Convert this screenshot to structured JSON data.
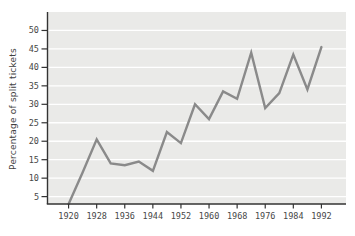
{
  "chart_data": {
    "type": "line",
    "title": "",
    "ylabel": "Percentage of split tickets",
    "xlabel": "",
    "x": [
      1920,
      1924,
      1928,
      1932,
      1936,
      1940,
      1944,
      1948,
      1952,
      1956,
      1960,
      1964,
      1968,
      1972,
      1976,
      1980,
      1984,
      1988,
      1992
    ],
    "values": [
      3,
      11.5,
      20.5,
      14,
      13.5,
      14.5,
      12,
      22.5,
      19.5,
      30,
      26,
      33.5,
      31.5,
      44,
      29,
      33,
      43.5,
      34,
      45.5
    ],
    "x_tick_labels": [
      "1920",
      "1928",
      "1936",
      "1944",
      "1952",
      "1960",
      "1968",
      "1976",
      "1984",
      "1992"
    ],
    "y_tick_labels": [
      "5",
      "10",
      "15",
      "20",
      "25",
      "30",
      "35",
      "40",
      "45",
      "50"
    ],
    "xlim": [
      1914,
      1999
    ],
    "ylim": [
      3,
      55
    ],
    "grid": "horizontal-white-lines-at-y-ticks",
    "legend": "none",
    "colors": {
      "line": "#8a8a8a",
      "axis": "#333333",
      "grid": "#ffffff",
      "plot_background": "#eaeae8",
      "page_background": "#ffffff",
      "label_text": "#474747"
    }
  }
}
